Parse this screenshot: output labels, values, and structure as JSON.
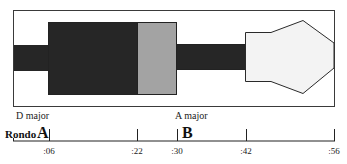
{
  "diagram": {
    "colors": {
      "frame": "#3a3a3a",
      "dark_block": "#262626",
      "gray_block": "#a3a3a3",
      "light_shape": "#f3f3f3",
      "background": "#ffffff"
    },
    "key_labels": [
      {
        "text": "D major",
        "x": 16,
        "y": 111
      },
      {
        "text": "A major",
        "x": 175,
        "y": 111
      }
    ]
  },
  "timeline": {
    "title_prefix": "Rondo",
    "sections": [
      {
        "letter": "A",
        "x": 37
      },
      {
        "letter": "B",
        "x": 182
      }
    ],
    "ticks": [
      {
        "label": ":06",
        "x": 49
      },
      {
        "label": ":22",
        "x": 137
      },
      {
        "label": ":30",
        "x": 177
      },
      {
        "label": ":42",
        "x": 246
      },
      {
        "label": ":56",
        "x": 334
      }
    ]
  }
}
